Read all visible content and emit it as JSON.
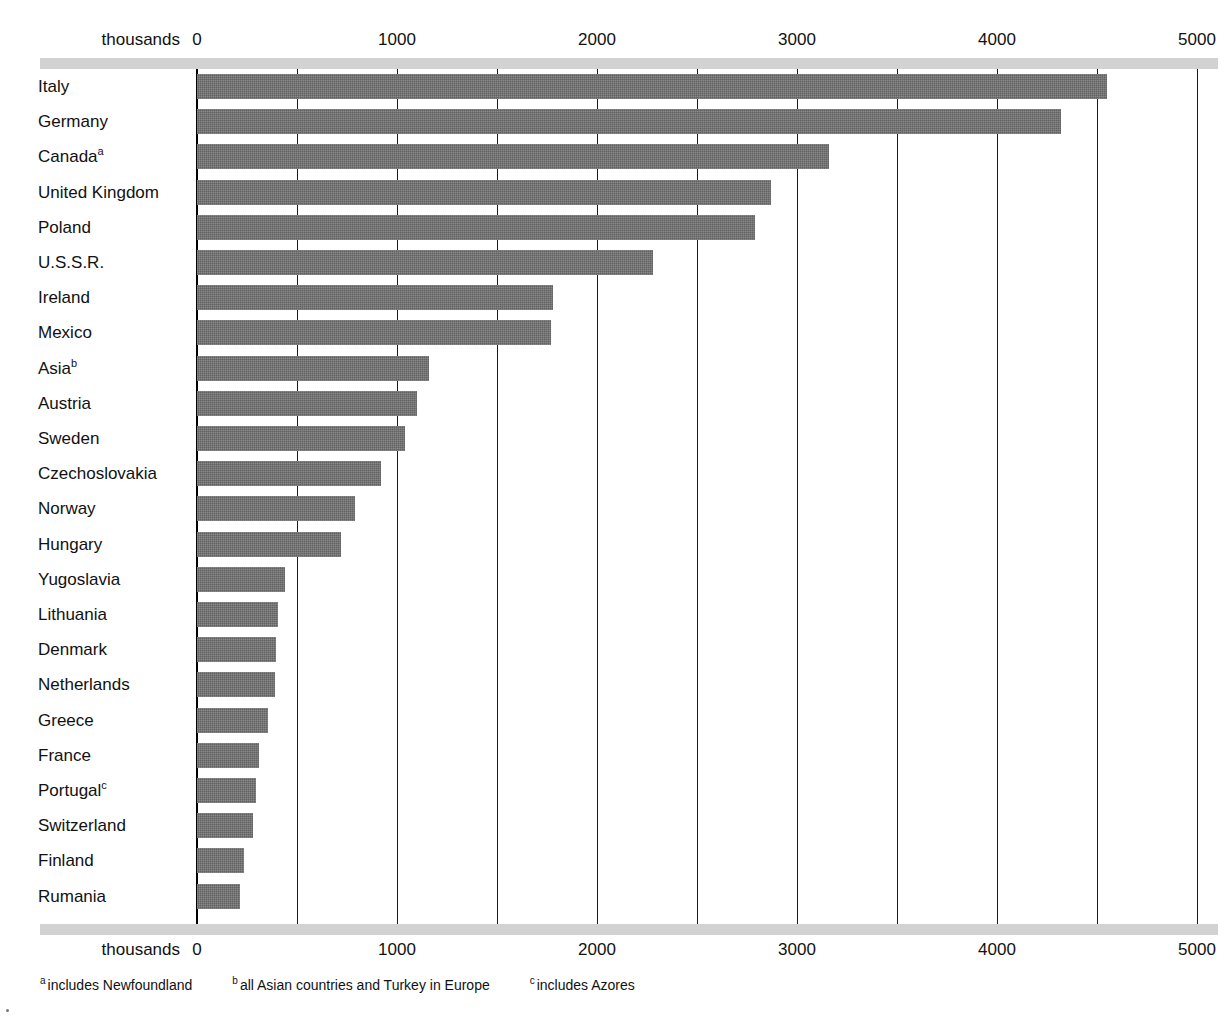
{
  "chart_data": {
    "type": "bar",
    "orientation": "horizontal",
    "title": "",
    "xlabel": "thousands",
    "ylabel": "",
    "xlim": [
      0,
      5000
    ],
    "grid": true,
    "legend": null,
    "tick_labels": [
      "0",
      "1000",
      "2000",
      "3000",
      "4000",
      "5000"
    ],
    "ticks": [
      0,
      1000,
      2000,
      3000,
      4000,
      5000
    ],
    "gridline_values": [
      0,
      500,
      1000,
      1500,
      2000,
      2500,
      3000,
      3500,
      4000,
      4500,
      5000
    ],
    "units_label": "thousands",
    "bar_color": "#6d6d6d",
    "categories": [
      "Italy",
      "Germany",
      "Canada",
      "United Kingdom",
      "Poland",
      "U.S.S.R.",
      "Ireland",
      "Mexico",
      "Asia",
      "Austria",
      "Sweden",
      "Czechoslovakia",
      "Norway",
      "Hungary",
      "Yugoslavia",
      "Lithuania",
      "Denmark",
      "Netherlands",
      "Greece",
      "France",
      "Portugal",
      "Switzerland",
      "Finland",
      "Rumania"
    ],
    "values": [
      4550,
      4320,
      3160,
      2870,
      2790,
      2280,
      1780,
      1770,
      1160,
      1100,
      1040,
      920,
      790,
      720,
      440,
      405,
      395,
      390,
      355,
      310,
      295,
      280,
      235,
      215
    ],
    "footnote_markers": {
      "Canada": "a",
      "Asia": "b",
      "Portugal": "c"
    }
  },
  "axis": {
    "units_label": "thousands"
  },
  "footnotes": [
    {
      "marker": "a",
      "text": "includes Newfoundland"
    },
    {
      "marker": "b",
      "text": "all Asian countries and Turkey in Europe"
    },
    {
      "marker": "c",
      "text": "includes Azores"
    }
  ]
}
